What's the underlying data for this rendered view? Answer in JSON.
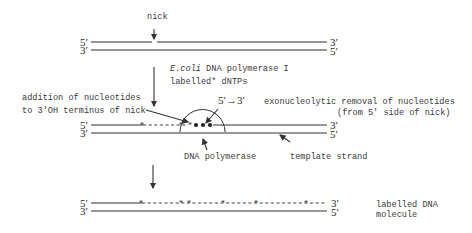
{
  "labels": {
    "nick": "nick",
    "enzyme_prefix": "E.coli",
    "enzyme_rest": " DNA polymerase I",
    "dntps": "labelled* dNTPs",
    "addition_line1": "addition of nucleotides",
    "addition_line2": "to 3'OH terminus of nick",
    "direction": "5′→3′",
    "exo_line1": "exonucleolytic removal of nucleotides",
    "exo_line2": "(from 5' side of nick)",
    "dna_polymerase": "DNA polymerase",
    "template_strand": "template strand",
    "result_line1": "labelled DNA",
    "result_line2": "molecule"
  },
  "strand_ends": {
    "five_prime": "5′",
    "three_prime": "3′"
  },
  "stages": [
    {
      "name": "nicked-duplex"
    },
    {
      "name": "nick-translation"
    },
    {
      "name": "labelled-product"
    }
  ]
}
